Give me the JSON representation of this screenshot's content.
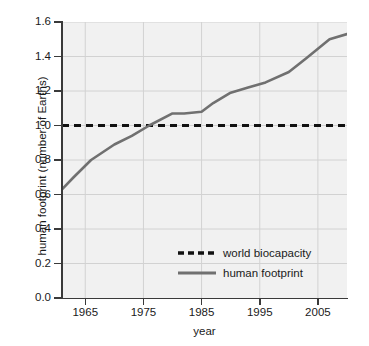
{
  "chart_data": {
    "type": "line",
    "title": "",
    "xlabel": "year",
    "ylabel": "human footprint (number of Earths)",
    "xlim": [
      1961,
      2010
    ],
    "ylim": [
      0.0,
      1.6
    ],
    "grid": true,
    "legend_position": "inside-lower-center",
    "x_ticks": [
      1965,
      1975,
      1985,
      1995,
      2005
    ],
    "x_tick_labels": [
      "1965",
      "1975",
      "1985",
      "1995",
      "2005"
    ],
    "y_ticks": [
      0.0,
      0.2,
      0.4,
      0.6,
      0.8,
      1.0,
      1.2,
      1.4,
      1.6
    ],
    "y_tick_labels": [
      "0.0",
      "0.2",
      "0.4",
      "0.6",
      "0.8",
      "1.0",
      "1.2",
      "1.4",
      "1.6"
    ],
    "series": [
      {
        "name": "world biocapacity",
        "style": "dashed",
        "color": "#111111",
        "x": [
          1961,
          2010
        ],
        "values": [
          1.0,
          1.0
        ]
      },
      {
        "name": "human footprint",
        "style": "solid",
        "color": "#707070",
        "x": [
          1961,
          1963,
          1966,
          1970,
          1973,
          1976,
          1980,
          1982,
          1985,
          1987,
          1990,
          1993,
          1996,
          2000,
          2003,
          2007,
          2010
        ],
        "values": [
          0.63,
          0.7,
          0.8,
          0.89,
          0.94,
          1.0,
          1.07,
          1.07,
          1.08,
          1.13,
          1.19,
          1.22,
          1.25,
          1.31,
          1.39,
          1.5,
          1.53
        ]
      }
    ]
  },
  "legend": {
    "items": [
      {
        "label": "world biocapacity",
        "style": "dashed",
        "color": "#111111"
      },
      {
        "label": "human footprint",
        "style": "solid",
        "color": "#707070"
      }
    ]
  },
  "colors": {
    "plot_background": "#f1f1f1",
    "page_background": "#ffffff",
    "grid": "#d2d2d2",
    "axis": "#3a3a3a",
    "text": "#1a1a1a",
    "footprint_line": "#707070",
    "biocapacity_line": "#111111"
  }
}
